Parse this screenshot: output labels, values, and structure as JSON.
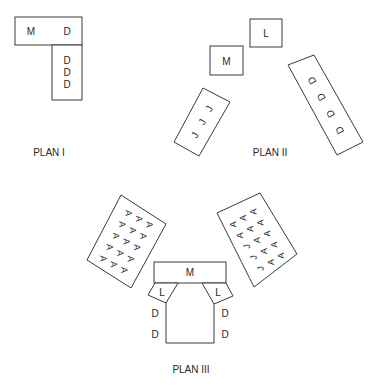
{
  "plans": [
    {
      "title": "PLAN I",
      "tables": [
        {
          "labels": [
            "M",
            "D"
          ]
        },
        {
          "labels": [
            "D",
            "D",
            "D"
          ]
        }
      ]
    },
    {
      "title": "PLAN II",
      "tables": [
        {
          "labels": [
            "L"
          ]
        },
        {
          "labels": [
            "M"
          ]
        },
        {
          "labels": [
            "J",
            "J",
            "J"
          ]
        },
        {
          "labels": [
            "D",
            "D",
            "D",
            "D"
          ]
        }
      ]
    },
    {
      "title": "PLAN III",
      "tables": [
        {
          "name": "left-audience",
          "rows": [
            [
              "A",
              "A",
              "A"
            ],
            [
              "A",
              "A",
              "A"
            ],
            [
              "A",
              "A",
              "A"
            ],
            [
              "A",
              "A",
              "A"
            ],
            [
              "A",
              "A",
              "A"
            ]
          ]
        },
        {
          "name": "right-audience",
          "rows": [
            [
              "A",
              "A",
              "A"
            ],
            [
              "A",
              "A",
              "A"
            ],
            [
              "J",
              "A",
              "A"
            ],
            [
              "J",
              "A",
              "A"
            ],
            [
              "J",
              "A",
              "A"
            ]
          ]
        },
        {
          "name": "head-table",
          "labels": [
            "M"
          ]
        },
        {
          "name": "left-wing",
          "labels": [
            "L"
          ]
        },
        {
          "name": "right-wing",
          "labels": [
            "L"
          ]
        },
        {
          "name": "left-side-seats",
          "labels": [
            "D",
            "D"
          ]
        },
        {
          "name": "right-side-seats",
          "labels": [
            "D",
            "D"
          ]
        }
      ]
    }
  ]
}
